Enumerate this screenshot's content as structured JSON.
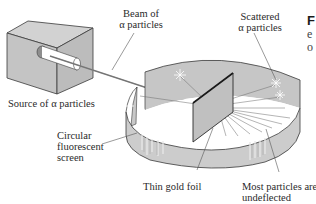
{
  "figure": {
    "labels": {
      "beam": [
        "Beam of",
        "α particles"
      ],
      "scattered": [
        "Scattered",
        "α particles"
      ],
      "source": "Source of α particles",
      "screen": [
        "Circular",
        "fluorescent",
        "screen"
      ],
      "foil": "Thin gold foil",
      "undeflected": [
        "Most particles are",
        "undeflected"
      ]
    },
    "caption_fragment": {
      "first": "F",
      "second": "e",
      "third": "o"
    },
    "colors": {
      "surface": "#c8c8c8",
      "surface_dark": "#b4b4b4",
      "surface_light": "#dcdcdc",
      "outline": "#3a3a3a",
      "beam": "#8a8a8a",
      "background": "#ffffff"
    }
  }
}
